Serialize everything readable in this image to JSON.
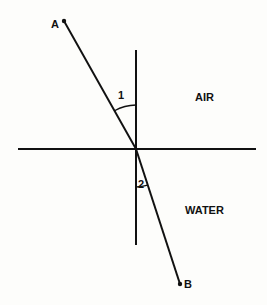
{
  "diagram": {
    "colors": {
      "ink": "#111111",
      "background": "#fdfdfb"
    },
    "points": {
      "A": {
        "label": "A",
        "x": 64,
        "y": 21
      },
      "B": {
        "label": "B",
        "x": 180,
        "y": 284
      },
      "O": {
        "x": 136,
        "y": 149
      }
    },
    "normal_line": {
      "x": 136,
      "y1": 50,
      "y2": 245
    },
    "interface_line": {
      "y": 149,
      "x1": 18,
      "x2": 256
    },
    "angles": [
      {
        "id": "angle-1",
        "label": "1",
        "description": "angle of incidence (in air)"
      },
      {
        "id": "angle-2",
        "label": "2",
        "description": "angle of refraction (in water)"
      }
    ],
    "media": {
      "upper": "AIR",
      "lower": "WATER"
    }
  }
}
